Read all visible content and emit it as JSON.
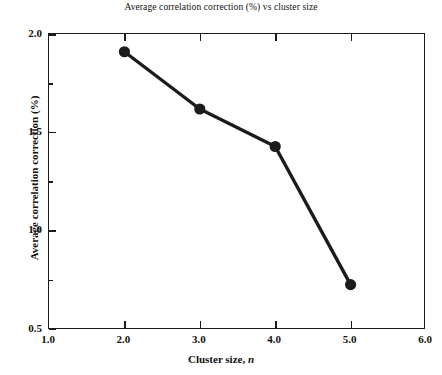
{
  "chart_data": {
    "type": "line",
    "title": "Average correlation correction (%) vs cluster size",
    "xlabel_text": "Cluster size,",
    "xlabel_variable": "n",
    "ylabel": "Average correlation correction (%)",
    "x": [
      2.0,
      3.0,
      4.0,
      5.0
    ],
    "values": [
      1.91,
      1.62,
      1.43,
      0.73
    ],
    "series": [
      {
        "name": "Average correlation correction",
        "x": [
          2.0,
          3.0,
          4.0,
          5.0
        ],
        "values": [
          1.91,
          1.62,
          1.43,
          0.73
        ]
      }
    ],
    "xlim": [
      1.0,
      6.0
    ],
    "ylim": [
      0.5,
      2.0
    ],
    "xticks": [
      1.0,
      2.0,
      3.0,
      4.0,
      5.0,
      6.0
    ],
    "xtick_labels": [
      "1.0",
      "2.0",
      "3.0",
      "4.0",
      "5.0",
      "6.0"
    ],
    "yticks": [
      0.5,
      1.0,
      1.5,
      2.0
    ],
    "ytick_labels": [
      "0.5",
      "1.0",
      "1.5",
      "2.0"
    ],
    "yticks_minor": [
      0.75,
      1.25,
      1.75
    ],
    "grid": false,
    "legend": false,
    "marker": "circle",
    "line_color": "#1b1b1b",
    "marker_color": "#1b1b1b",
    "background_color": "#ffffff",
    "frame_color": "#1b1b1b"
  }
}
